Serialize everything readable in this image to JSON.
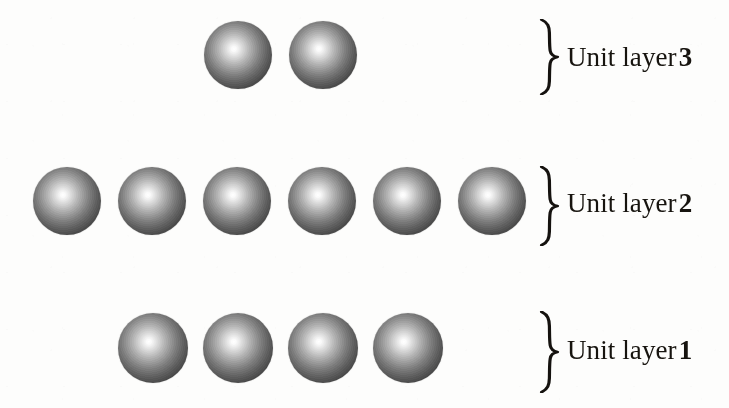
{
  "figure": {
    "background_color": "#fdfdfc",
    "width": 729,
    "height": 408
  },
  "sphere_style": {
    "highlight_color": "#ffffff",
    "mid_color": "#7e7e7e",
    "edge_color": "#1c1c1c",
    "diameter": 68
  },
  "brace_glyph": "}",
  "layers": [
    {
      "id": "unit-layer-3",
      "label_text": "Unit layer",
      "label_number": "3",
      "sphere_count": 2,
      "sphere_centers_x": [
        238,
        323
      ],
      "center_y": 55,
      "diameter": 68,
      "brace": {
        "x": 538,
        "y": 19,
        "height": 76
      },
      "label": {
        "x": 567,
        "y": 42
      }
    },
    {
      "id": "unit-layer-2",
      "label_text": "Unit layer",
      "label_number": "2",
      "sphere_count": 6,
      "sphere_centers_x": [
        67,
        152,
        237,
        322,
        407,
        492
      ],
      "center_y": 201,
      "diameter": 68,
      "brace": {
        "x": 538,
        "y": 166,
        "height": 80
      },
      "label": {
        "x": 567,
        "y": 188
      }
    },
    {
      "id": "unit-layer-1",
      "label_text": "Unit layer",
      "label_number": "1",
      "sphere_count": 4,
      "sphere_centers_x": [
        153,
        238,
        323,
        408
      ],
      "center_y": 348,
      "diameter": 70,
      "brace": {
        "x": 538,
        "y": 311,
        "height": 82
      },
      "label": {
        "x": 567,
        "y": 335
      }
    }
  ]
}
